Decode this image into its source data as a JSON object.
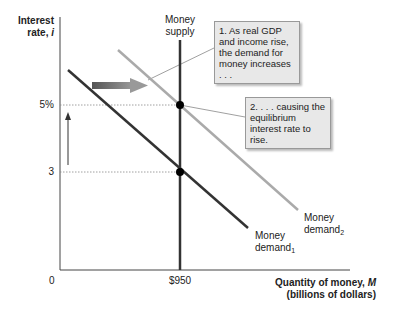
{
  "chart_data": {
    "type": "line",
    "title": "",
    "xlabel": "Quantity of money, M (billions of dollars)",
    "ylabel": "Interest rate, i",
    "x_ticks": [
      "0",
      "$950"
    ],
    "y_ticks": [
      "3",
      "5%"
    ],
    "grid": false,
    "series": [
      {
        "name": "Money supply",
        "type": "vertical",
        "x": 950,
        "color": "#333333"
      },
      {
        "name": "Money demand1",
        "points": [
          [
            0,
            6.1
          ],
          [
            950,
            3
          ],
          [
            1200,
            2.2
          ]
        ],
        "color": "#333333"
      },
      {
        "name": "Money demand2",
        "points": [
          [
            200,
            6.7
          ],
          [
            950,
            5
          ],
          [
            1450,
            3.6
          ]
        ],
        "color": "#aaaaaa"
      }
    ],
    "equilibria": [
      {
        "x": 950,
        "y": 3
      },
      {
        "x": 950,
        "y": 5
      }
    ],
    "annotations": [
      "1. As real GDP and income rise, the demand for money increases . . .",
      "2. . . . causing the equilibrium interest rate to rise."
    ]
  },
  "axes": {
    "y_title_line1": "Interest",
    "y_title_line2": "rate, i",
    "x_title_line1": "Quantity of money, M",
    "x_title_line2": "(billions of dollars)",
    "origin": "0",
    "x_tick": "$950",
    "y_tick_high": "5%",
    "y_tick_low": "3"
  },
  "labels": {
    "supply_line1": "Money",
    "supply_line2": "supply",
    "demand1_line1": "Money",
    "demand1_line2": "demand",
    "demand1_sub": "1",
    "demand2_line1": "Money",
    "demand2_line2": "demand",
    "demand2_sub": "2"
  },
  "callouts": {
    "one": "1. As real GDP and income rise, the demand for money increases . . .",
    "two": "2. . . . causing the equilibrium interest rate to rise."
  },
  "colors": {
    "dark_line": "#333333",
    "light_line": "#aaaaaa",
    "callout_bg": "#e8e8e8"
  }
}
